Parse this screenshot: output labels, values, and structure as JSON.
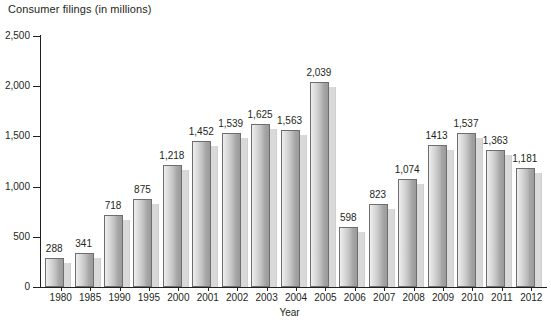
{
  "chart_data": {
    "type": "bar",
    "title": "Consumer filings (in millions)",
    "xlabel": "Year",
    "ylabel": "",
    "ylim": [
      0,
      2500
    ],
    "ytick_values": [
      0,
      500,
      1000,
      1500,
      2000,
      2500
    ],
    "ytick_labels": [
      "0",
      "500",
      "1,000",
      "1,500",
      "2,000",
      "2,500"
    ],
    "grid": false,
    "legend": null,
    "categories": [
      "1980",
      "1985",
      "1990",
      "1995",
      "2000",
      "2001",
      "2002",
      "2003",
      "2004",
      "2005",
      "2006",
      "2007",
      "2008",
      "2009",
      "2010",
      "2011",
      "2012"
    ],
    "values": [
      288,
      341,
      718,
      875,
      1218,
      1452,
      1539,
      1625,
      1563,
      2039,
      598,
      823,
      1074,
      1413,
      1537,
      1363,
      1181
    ],
    "value_labels": [
      "288",
      "341",
      "718",
      "875",
      "1,218",
      "1,452",
      "1,539",
      "1,625",
      "1,563",
      "2,039",
      "598",
      "823",
      "1,074",
      "1413",
      "1,537",
      "1,363",
      "1,181"
    ],
    "bar_fill_light": "#efefef",
    "bar_fill_dark": "#9a9a9a",
    "bar_border": "#6e6e6e",
    "bar_shadow": "#d9d9d9",
    "axis_color": "#231f20"
  }
}
